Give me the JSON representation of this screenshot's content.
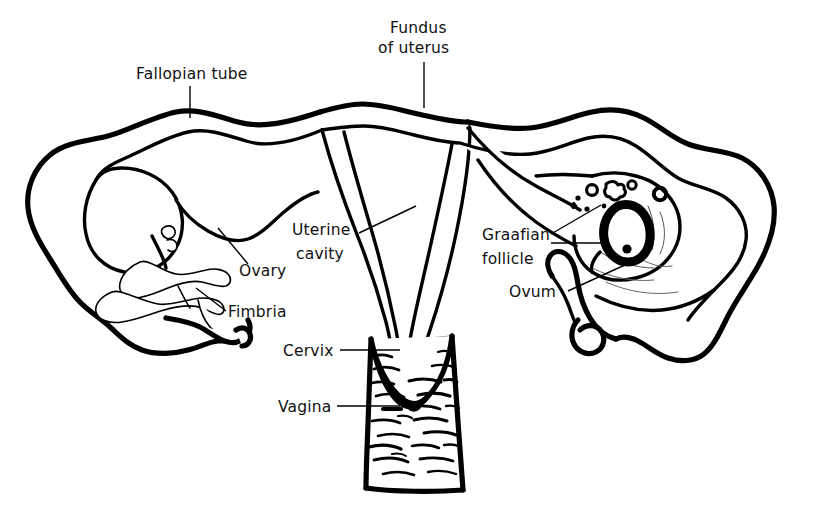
{
  "diagram": {
    "background_color": "#ffffff",
    "ink_color": "#000000",
    "labels": [
      {
        "id": "fallopian-tube",
        "text": "Fallopian tube",
        "text_x": 136,
        "text_y": 79,
        "anchor": "start",
        "leader": "M 190 86 L 190 118"
      },
      {
        "id": "fundus-of-uterus",
        "text_line1": "Fundus",
        "text_line2": "of uterus",
        "text_x": 390,
        "text_y": 33,
        "anchor": "start",
        "leader": "M 424 62 L 424 108"
      },
      {
        "id": "uterine-cavity",
        "text_line1": "Uterine",
        "text_line2": "cavity",
        "text_x": 292,
        "text_y": 235,
        "anchor": "start",
        "leader": "M 359 233 L 416 206"
      },
      {
        "id": "ovary",
        "text": "Ovary",
        "text_x": 239,
        "text_y": 276,
        "anchor": "start",
        "leader": "M 248 264 L 218 228"
      },
      {
        "id": "fimbria",
        "text": "Fimbria",
        "text_x": 228,
        "text_y": 317,
        "anchor": "start",
        "leader": "M 226 311 L 196 288"
      },
      {
        "id": "cervix",
        "text": "Cervix",
        "text_x": 283,
        "text_y": 356,
        "anchor": "start",
        "leader": "M 340 350 L 400 350"
      },
      {
        "id": "vagina",
        "text": "Vagina",
        "text_x": 278,
        "text_y": 412,
        "anchor": "start",
        "leader": "M 337 406 L 400 406"
      },
      {
        "id": "graafian-follicle",
        "text_line1": "Graafian",
        "text_line2": "follicle",
        "text_x": 482,
        "text_y": 240,
        "anchor": "start",
        "leader": "M 551 234 L 601 205",
        "leader2": "M 551 243 L 606 243"
      },
      {
        "id": "ovum",
        "text": "Ovum",
        "text_x": 509,
        "text_y": 297,
        "anchor": "start",
        "leader": "M 568 291 L 627 264"
      }
    ],
    "structures": [
      {
        "id": "left-fallopian-tube",
        "name": "left fallopian tube"
      },
      {
        "id": "left-ovary",
        "name": "left ovary"
      },
      {
        "id": "left-fimbria",
        "name": "left fimbria"
      },
      {
        "id": "uterus-body",
        "name": "uterus body"
      },
      {
        "id": "uterine-cavity-void",
        "name": "uterine cavity"
      },
      {
        "id": "cervix-canal",
        "name": "cervix"
      },
      {
        "id": "vagina-canal",
        "name": "vagina with rugae"
      },
      {
        "id": "right-fallopian-tube",
        "name": "right fallopian tube (sectioned)"
      },
      {
        "id": "right-ovary-section",
        "name": "right ovary, sectioned"
      },
      {
        "id": "graafian-follicles",
        "name": "graafian follicles"
      },
      {
        "id": "mature-follicle-ovum",
        "name": "mature follicle containing ovum"
      },
      {
        "id": "right-fimbria",
        "name": "right fimbria"
      }
    ]
  }
}
